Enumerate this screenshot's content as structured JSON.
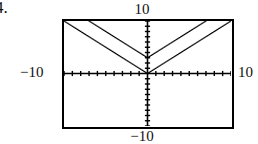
{
  "item": {
    "marker": "4."
  },
  "window_labels": {
    "ymax": "10",
    "ymin": "−10",
    "xmin": "−10",
    "xmax": "10"
  },
  "chart_data": {
    "type": "line",
    "title": "",
    "subtitle": "",
    "xlabel": "",
    "ylabel": "",
    "xlim": [
      -10,
      10
    ],
    "ylim": [
      -10,
      10
    ],
    "grid": false,
    "legend": null,
    "legend_position": "none",
    "axes": {
      "x_axis_visible": true,
      "y_axis_visible": true,
      "x_tick_interval": 1,
      "y_tick_interval": 1,
      "x_tick_labels": [],
      "y_tick_labels": [],
      "tick_style": "hash-marks-on-axis",
      "frame": "rectangular-calculator-window"
    },
    "annotations": [
      {
        "text": "10",
        "position": "above-window-top-center"
      },
      {
        "text": "−10",
        "position": "below-window-bottom-center"
      },
      {
        "text": "−10",
        "position": "left-of-window-mid"
      },
      {
        "text": "10",
        "position": "right-of-window-mid"
      }
    ],
    "series": [
      {
        "name": "y = |x|",
        "style": "dotted-pixel-trace",
        "vertex": [
          0,
          0
        ],
        "slope_left": -1,
        "slope_right": 1,
        "x": [
          -10,
          0,
          10
        ],
        "values": [
          10,
          0,
          10
        ]
      },
      {
        "name": "y = |x| + 3",
        "style": "dotted-pixel-trace",
        "vertex": [
          0,
          3
        ],
        "slope_left": -1,
        "slope_right": 1,
        "x": [
          -7,
          0,
          7
        ],
        "values": [
          10,
          3,
          10
        ]
      }
    ]
  }
}
